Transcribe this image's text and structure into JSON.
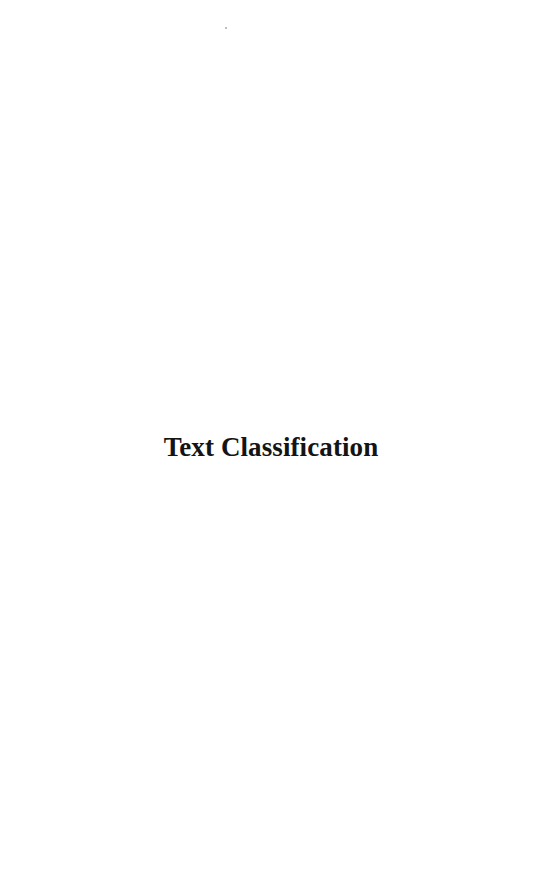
{
  "page": {
    "title": "Text Classification"
  }
}
